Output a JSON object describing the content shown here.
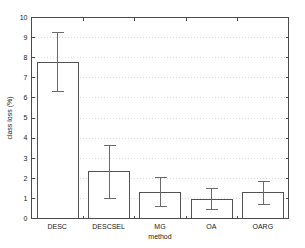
{
  "chart_data": {
    "type": "bar",
    "title": "",
    "xlabel": "method",
    "ylabel": "class loss (%)",
    "categories": [
      "DESC",
      "DESCSEL",
      "MG",
      "OA",
      "OARG"
    ],
    "values": [
      7.75,
      2.32,
      1.28,
      0.95,
      1.28
    ],
    "error_low": [
      6.3,
      1.0,
      0.58,
      0.43,
      0.72
    ],
    "error_high": [
      9.25,
      3.65,
      2.03,
      1.47,
      1.83
    ],
    "ylim": [
      0,
      10
    ],
    "ytick_labels": [
      "0",
      "1",
      "2",
      "3",
      "4",
      "5",
      "6",
      "7",
      "8",
      "9",
      "10"
    ],
    "ytick_values": [
      0,
      1,
      2,
      3,
      4,
      5,
      6,
      7,
      8,
      9,
      10
    ],
    "grid": "horizontal-dotted",
    "legend": "none",
    "bar_fill_color": "#ffffff",
    "bar_edge_color": "#525252",
    "errorbar_color": "#6b6b6b",
    "grid_color": "#cfcfcf",
    "axis_color": "#4a4a4a",
    "background_color": "#ffffff"
  }
}
